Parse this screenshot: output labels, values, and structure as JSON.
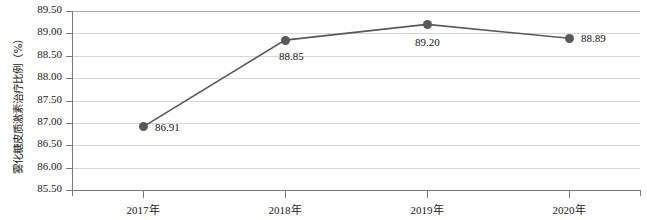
{
  "chart_data": {
    "type": "line",
    "title": "",
    "xlabel": "",
    "ylabel": "雾化糖皮质激素治疗比例（%）",
    "categories": [
      "2017年",
      "2018年",
      "2019年",
      "2020年"
    ],
    "values": [
      86.91,
      88.85,
      89.2,
      88.89
    ],
    "point_labels": [
      "86.91",
      "88.85",
      "89.20",
      "88.89"
    ],
    "ylim": [
      85.5,
      89.5
    ],
    "ytick_step": 0.5,
    "ytick_labels": [
      "89.50",
      "89.00",
      "88.50",
      "88.00",
      "87.50",
      "87.00",
      "86.50",
      "86.00",
      "85.50"
    ],
    "ytick_values": [
      89.5,
      89.0,
      88.5,
      88.0,
      87.5,
      87.0,
      86.5,
      86.0,
      85.5
    ],
    "grid": true,
    "legend": "none",
    "series_color": "#595959",
    "grid_color": "#d6d6d6",
    "axis_color": "#7a7a7a",
    "marker": "circle"
  }
}
